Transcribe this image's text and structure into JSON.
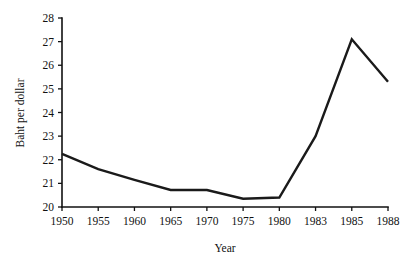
{
  "chart_data": {
    "type": "line",
    "title": "",
    "xlabel": "Year",
    "ylabel": "Baht per dollar",
    "categories": [
      "1950",
      "1955",
      "1960",
      "1965",
      "1970",
      "1975",
      "1980",
      "1983",
      "1985",
      "1988"
    ],
    "values": [
      22.25,
      21.6,
      21.15,
      20.72,
      20.72,
      20.35,
      20.4,
      23.0,
      27.1,
      25.3
    ],
    "series": [
      {
        "name": "Baht per dollar",
        "values": [
          22.25,
          21.6,
          21.15,
          20.72,
          20.72,
          20.35,
          20.4,
          23.0,
          27.1,
          25.3
        ]
      }
    ],
    "ylim": [
      20,
      28
    ],
    "y_ticks": [
      "20",
      "21",
      "22",
      "23",
      "24",
      "25",
      "26",
      "27",
      "28"
    ],
    "x_ticks": [
      "1950",
      "1955",
      "1960",
      "1965",
      "1970",
      "1975",
      "1980",
      "1983",
      "1985",
      "1988"
    ],
    "grid": false,
    "legend": "none",
    "line_color": "#1a1a1a",
    "axis_color": "#111111",
    "background_color": "#ffffff",
    "x_axis_scale": "categorical-even-spacing"
  }
}
